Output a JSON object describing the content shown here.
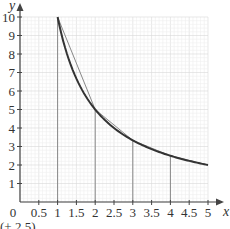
{
  "chart_data": {
    "type": "line",
    "title": "",
    "xlabel": "x",
    "ylabel": "y",
    "xlim": [
      0,
      5
    ],
    "ylim": [
      0,
      10
    ],
    "grid": true,
    "x_ticks": [
      "0",
      "0.5",
      "1",
      "1.5",
      "2",
      "2.5",
      "3",
      "3.5",
      "4",
      "4.5",
      "5"
    ],
    "y_ticks": [
      "1",
      "2",
      "3",
      "4",
      "5",
      "6",
      "7",
      "8",
      "9",
      "10"
    ],
    "series": [
      {
        "name": "curve y = 10/x",
        "x": [
          1,
          1.5,
          2,
          2.5,
          3,
          3.5,
          4,
          4.5,
          5
        ],
        "values": [
          10,
          6.67,
          5,
          4,
          3.33,
          2.86,
          2.5,
          2.22,
          2
        ]
      },
      {
        "name": "chords (trapezium tops)",
        "x": [
          1,
          2,
          3,
          4,
          5
        ],
        "values": [
          10,
          5,
          3.33,
          2.5,
          2
        ]
      }
    ],
    "vertical_lines_x": [
      1,
      2,
      3,
      4
    ]
  },
  "caption_partial": "(+ 2.5)"
}
